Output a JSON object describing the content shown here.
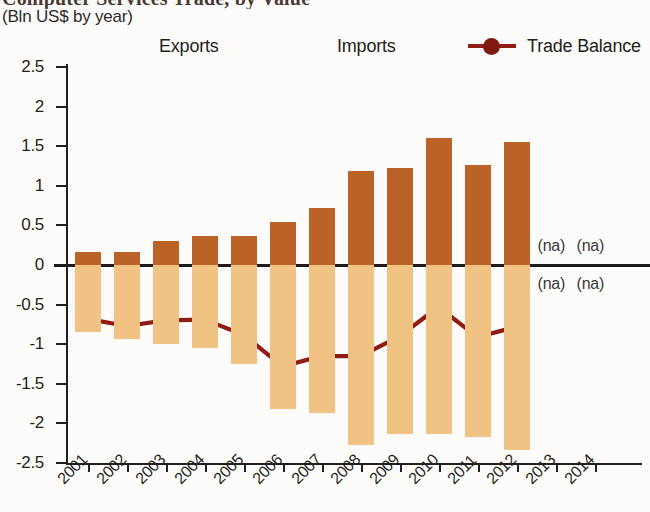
{
  "header": {
    "title": "Computer Services Trade, by Value",
    "subtitle": "(Bln US$ by year)"
  },
  "legend": {
    "position": "top",
    "items": [
      {
        "label": "Exports",
        "type": "swatch",
        "color": "#bb6326"
      },
      {
        "label": "Imports",
        "type": "swatch",
        "color": "#f0c283"
      },
      {
        "label": "Trade Balance",
        "type": "line-marker",
        "color": "#8f1d16"
      }
    ]
  },
  "axes": {
    "y_ticks": [
      "2.5",
      "2",
      "1.5",
      "1",
      "0.5",
      "0",
      "-0.5",
      "-1",
      "-1.5",
      "-2",
      "-2.5"
    ],
    "y_tick_values": [
      2.5,
      2,
      1.5,
      1,
      0.5,
      0,
      -0.5,
      -1,
      -1.5,
      -2,
      -2.5
    ],
    "x_ticks": [
      "2001",
      "2002",
      "2003",
      "2004",
      "2005",
      "2006",
      "2007",
      "2008",
      "2009",
      "2010",
      "2011",
      "2012",
      "2013",
      "2014"
    ]
  },
  "annotations": {
    "na_text": "(na)",
    "na_years": [
      "2013",
      "2014"
    ],
    "na_positions": [
      "above-zero",
      "below-zero"
    ]
  },
  "colors": {
    "exports": "#bb6326",
    "imports": "#f0c283",
    "balance": "#8f1d16",
    "balance_marker": "#7e1a12",
    "axis": "#231f20",
    "background": "#fdfcfa"
  },
  "chart_data": {
    "type": "bar",
    "title": "Computer Services Trade, by Value",
    "subtitle": "(Bln US$ by year)",
    "xlabel": "",
    "ylabel": "Bln US$",
    "ylim": [
      -2.5,
      2.5
    ],
    "grid": false,
    "legend_position": "top",
    "categories": [
      "2001",
      "2002",
      "2003",
      "2004",
      "2005",
      "2006",
      "2007",
      "2008",
      "2009",
      "2010",
      "2011",
      "2012",
      "2013",
      "2014"
    ],
    "series": [
      {
        "name": "Exports",
        "type": "bar",
        "color": "#bb6326",
        "values": [
          0.17,
          0.16,
          0.3,
          0.36,
          0.37,
          0.54,
          0.72,
          1.19,
          1.22,
          1.6,
          1.26,
          1.55,
          null,
          null
        ]
      },
      {
        "name": "Imports",
        "type": "bar",
        "color": "#f0c283",
        "values": [
          -0.85,
          -0.93,
          -1.0,
          -1.05,
          -1.25,
          -1.82,
          -1.87,
          -2.27,
          -2.13,
          -2.13,
          -2.17,
          -2.33,
          null,
          null
        ]
      },
      {
        "name": "Trade Balance",
        "type": "line",
        "color": "#8f1d16",
        "values": [
          -0.68,
          -0.77,
          -0.7,
          -0.69,
          -0.88,
          -1.28,
          -1.15,
          -1.15,
          -0.9,
          -0.53,
          -0.91,
          -0.78,
          null,
          null
        ]
      }
    ]
  }
}
